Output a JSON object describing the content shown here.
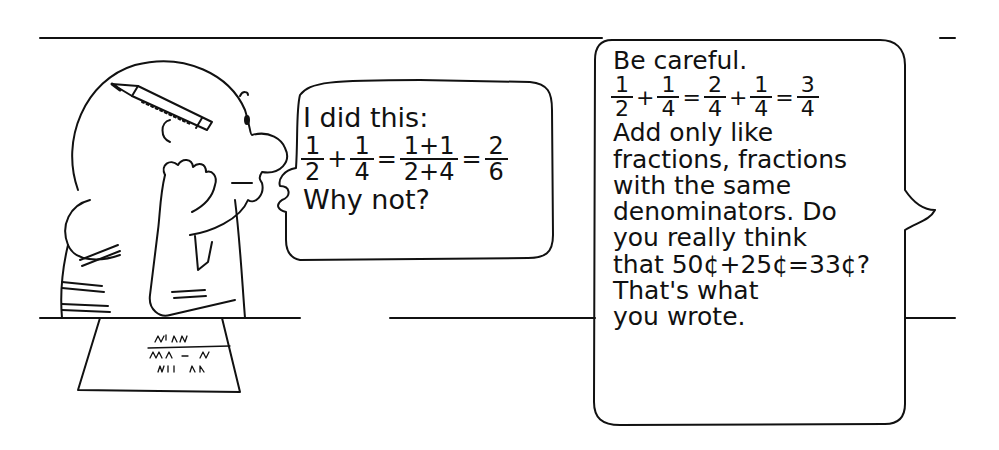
{
  "scene": {
    "description": "Cartoon: boy with pencil behind ear at desk asks about adding fractions; teacher replies in a speech bubble",
    "colors": {
      "ink": "#111111",
      "paper": "#ffffff"
    }
  },
  "student_bubble": {
    "line1": "I did this:",
    "equation": [
      {
        "num": "1",
        "den": "2"
      },
      {
        "op": "+"
      },
      {
        "num": "1",
        "den": "4"
      },
      {
        "op": "="
      },
      {
        "num": "1+1",
        "den": "2+4"
      },
      {
        "op": "="
      },
      {
        "num": "2",
        "den": "6"
      }
    ],
    "line3": "Why not?"
  },
  "teacher_bubble": {
    "line1": "Be careful.",
    "equation": [
      {
        "num": "1",
        "den": "2"
      },
      {
        "op": "+"
      },
      {
        "num": "1",
        "den": "4"
      },
      {
        "op": "="
      },
      {
        "num": "2",
        "den": "4"
      },
      {
        "op": "+"
      },
      {
        "num": "1",
        "den": "4"
      },
      {
        "op": "="
      },
      {
        "num": "3",
        "den": "4"
      }
    ],
    "lines": [
      "Add only like",
      "fractions, fractions",
      "with the same",
      "denominators. Do",
      "you really think",
      "that 50¢+25¢=33¢?",
      "That's what",
      "you wrote."
    ]
  }
}
